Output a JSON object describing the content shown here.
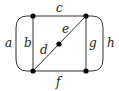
{
  "diagram": {
    "type": "graph",
    "vertices": [
      {
        "id": "v_top_left",
        "x": 33,
        "y": 16
      },
      {
        "id": "v_top_right",
        "x": 86,
        "y": 16
      },
      {
        "id": "v_bottom_left",
        "x": 33,
        "y": 71
      },
      {
        "id": "v_bottom_right",
        "x": 86,
        "y": 71
      },
      {
        "id": "v_center",
        "x": 59,
        "y": 44
      }
    ],
    "edges": [
      {
        "label": "a",
        "from": "v_top_left",
        "to": "v_bottom_left",
        "shape": "curved-left"
      },
      {
        "label": "b",
        "from": "v_top_left",
        "to": "v_bottom_left",
        "shape": "straight"
      },
      {
        "label": "c",
        "from": "v_top_left",
        "to": "v_top_right",
        "shape": "straight"
      },
      {
        "label": "d",
        "from": "v_bottom_left",
        "to": "v_center",
        "shape": "straight"
      },
      {
        "label": "e",
        "from": "v_center",
        "to": "v_top_right",
        "shape": "straight"
      },
      {
        "label": "f",
        "from": "v_bottom_left",
        "to": "v_bottom_right",
        "shape": "straight"
      },
      {
        "label": "g",
        "from": "v_top_right",
        "to": "v_bottom_right",
        "shape": "straight"
      },
      {
        "label": "h",
        "from": "v_top_right",
        "to": "v_bottom_right",
        "shape": "curved-right"
      }
    ],
    "labels": {
      "a": "a",
      "b": "b",
      "c": "c",
      "d": "d",
      "e": "e",
      "f": "f",
      "g": "g",
      "h": "h"
    }
  }
}
